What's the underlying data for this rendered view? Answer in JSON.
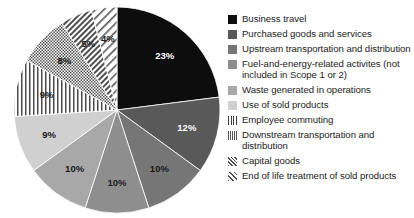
{
  "chart_data": {
    "type": "pie",
    "title": "",
    "subtitle": "",
    "xlabel": "",
    "ylabel": "",
    "legend_position": "right",
    "grid": false,
    "start_angle_deg": 0,
    "direction": "clockwise",
    "unit": "%",
    "categories": [
      "Business travel",
      "Purchased goods and services",
      "Upstream transportation and distribution",
      "Fuel-and-energy-related activites (not included in Scope 1 or 2)",
      "Waste generated in operations",
      "Use of sold products",
      "Employee commuting",
      "Downstream transportation and distribution",
      "Capital goods",
      "End of life treatment of sold products"
    ],
    "values": [
      23,
      12,
      10,
      10,
      10,
      9,
      9,
      8,
      5,
      4
    ],
    "labels": [
      "23%",
      "12%",
      "10%",
      "10%",
      "10%",
      "9%",
      "9%",
      "8%",
      "5%",
      "4%"
    ],
    "colors": [
      "#0d0d0d",
      "#595959",
      "#767676",
      "#8e8e8e",
      "#a8a8a8",
      "#d0d0d0",
      "#ffffff",
      "#ffffff",
      "#ffffff",
      "#ffffff"
    ],
    "fills": [
      "solid",
      "solid",
      "solid",
      "solid",
      "solid",
      "solid",
      "vertical-lines",
      "checker-dots",
      "dense-diagonal-hatch",
      "sparse-diagonal-stripes"
    ],
    "label_colors": [
      "light",
      "light",
      "dark",
      "dark",
      "dark",
      "dark",
      "dark",
      "dark",
      "dark",
      "dark"
    ]
  },
  "legend": {
    "items": [
      {
        "label": "Business travel",
        "swatch": "solid-black"
      },
      {
        "label": "Purchased goods and services",
        "swatch": "solid-dark-gray"
      },
      {
        "label": "Upstream transportation and distribution",
        "swatch": "solid-mid-gray"
      },
      {
        "label": "Fuel-and-energy-related activites (not included in Scope 1 or 2)",
        "swatch": "solid-gray"
      },
      {
        "label": "Waste generated in operations",
        "swatch": "solid-light-gray"
      },
      {
        "label": "Use of sold products",
        "swatch": "solid-lighter-gray"
      },
      {
        "label": "Employee commuting",
        "swatch": "vertical-lines"
      },
      {
        "label": "Downstream transportation and distribution",
        "swatch": "checker-dots"
      },
      {
        "label": "Capital goods",
        "swatch": "dense-diagonal-hatch"
      },
      {
        "label": "End of life treatment of sold products",
        "swatch": "sparse-diagonal-stripes"
      }
    ]
  }
}
